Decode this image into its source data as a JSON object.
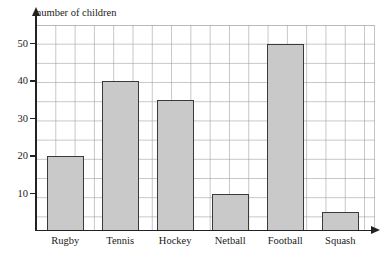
{
  "clipped_top_text": "",
  "chart_data": {
    "type": "bar",
    "title": "",
    "ylabel": "number of children",
    "xlabel": "",
    "categories": [
      "Rugby",
      "Tennis",
      "Hockey",
      "Netball",
      "Football",
      "Squash"
    ],
    "values": [
      20,
      40,
      35,
      10,
      50,
      5
    ],
    "ylim": [
      0,
      55
    ],
    "yticks": [
      10,
      20,
      30,
      40,
      50
    ],
    "ytick_labels": [
      "10",
      "20",
      "30",
      "40",
      "50"
    ],
    "grid": true,
    "minor_grid_step": 5,
    "legend": null,
    "bar_fill_color": "#c9c9c9",
    "bar_edge_color": "#3a3a3a",
    "grid_color": "#9696a0",
    "axis_color": "#222222"
  }
}
